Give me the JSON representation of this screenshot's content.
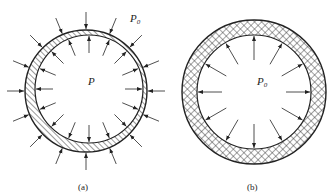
{
  "figure": {
    "panel_a": {
      "caption": "(a)",
      "outer_pressure_label": "P",
      "outer_pressure_subscript": "0",
      "inner_pressure_label": "P",
      "hatch": "diagonal",
      "outer_circle": {
        "cx": 86,
        "cy": 91,
        "r": 61
      },
      "inner_circle": {
        "cx": 89,
        "cy": 89,
        "r": 54
      },
      "arrow_count_outer": 16,
      "arrow_count_inner": 16
    },
    "panel_b": {
      "caption": "(b)",
      "inner_pressure_label": "P",
      "inner_pressure_subscript": "0",
      "hatch": "crosshatch",
      "outer_circle": {
        "cx": 254,
        "cy": 92,
        "r": 72
      },
      "inner_circle": {
        "cx": 254,
        "cy": 92,
        "r": 57
      },
      "arrow_count_inner": 12
    },
    "colors": {
      "line": "#222222",
      "background": "#ffffff"
    }
  }
}
